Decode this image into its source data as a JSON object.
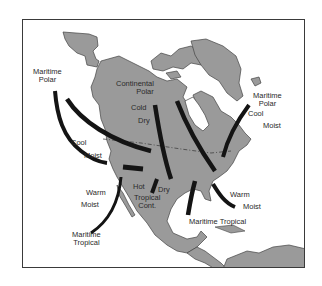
{
  "map": {
    "title": "North American Air Masses",
    "colors": {
      "land": "#9a9a9a",
      "water": "#ffffff",
      "arrow": "#141414",
      "border": "#3a3a3a",
      "text": "#2a2a2a"
    },
    "labels": {
      "mp_west_1": "Maritime",
      "mp_west_2": "Polar",
      "cp_1": "Continental",
      "cp_2": "Polar",
      "cold": "Cold",
      "dry_n": "Dry",
      "mp_east_1": "Maritime",
      "mp_east_2": "Polar",
      "cool_e": "Cool",
      "moist_e": "Moist",
      "cool_w": "Cool",
      "moist_w": "Moist",
      "warm_w": "Warm",
      "moist_sw": "Moist",
      "hot": "Hot",
      "dry_s": "Dry",
      "tropical": "Tropical",
      "cont": "Cont.",
      "warm_e": "Warm",
      "moist_se": "Moist",
      "mt_pacific_1": "Maritime",
      "mt_pacific_2": "Tropical",
      "mt_gulf": "Maritime Tropical"
    },
    "air_masses": [
      {
        "name": "Maritime Polar (Pacific)",
        "traits": [
          "Cool",
          "Moist"
        ]
      },
      {
        "name": "Continental Polar",
        "traits": [
          "Cold",
          "Dry"
        ]
      },
      {
        "name": "Maritime Polar (Atlantic)",
        "traits": [
          "Cool",
          "Moist"
        ]
      },
      {
        "name": "Maritime Tropical (Pacific)",
        "traits": [
          "Warm",
          "Moist"
        ]
      },
      {
        "name": "Continental Tropical",
        "traits": [
          "Hot",
          "Dry"
        ]
      },
      {
        "name": "Maritime Tropical (Gulf/Atlantic)",
        "traits": [
          "Warm",
          "Moist"
        ]
      }
    ]
  }
}
